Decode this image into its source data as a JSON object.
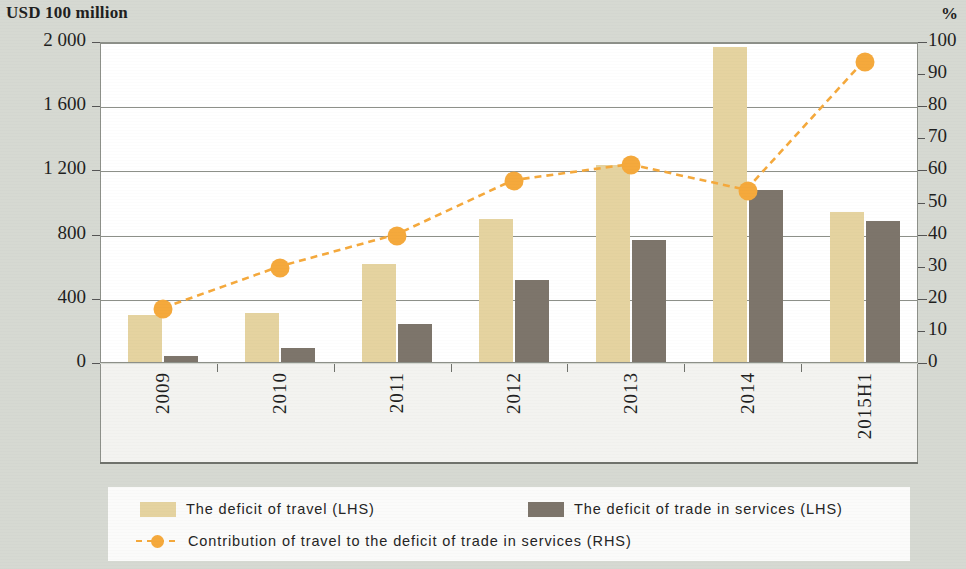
{
  "axis_titles": {
    "left_unit": "USD 100 million",
    "right_unit": "%"
  },
  "left_ticks": [
    "2 000",
    "1 600",
    "1 200",
    "800",
    "400",
    "0"
  ],
  "right_ticks": [
    "100",
    "90",
    "80",
    "70",
    "60",
    "50",
    "40",
    "30",
    "20",
    "10",
    "0"
  ],
  "categories": [
    "2009",
    "2010",
    "2011",
    "2012",
    "2013",
    "2014",
    "2015H1"
  ],
  "legend": {
    "travel": "The deficit of travel (LHS)",
    "services": "The deficit of trade in services (LHS)",
    "contribution": "Contribution of travel to the deficit of trade in services (RHS)"
  },
  "colors": {
    "travel_bar": "#e5d3a0",
    "services_bar": "#7d756b",
    "line": "#f5a93c",
    "page_background": "#d6d9d2",
    "plot_background": "#ffffff",
    "axis": "#8d9089"
  },
  "chart_data": {
    "type": "bar",
    "title": "",
    "xlabel": "",
    "ylabel": "USD 100 million",
    "y2label": "%",
    "categories": [
      "2009",
      "2010",
      "2011",
      "2012",
      "2013",
      "2014",
      "2015H1"
    ],
    "ylim": [
      0,
      2000
    ],
    "y2lim": [
      0,
      100
    ],
    "yticks": [
      0,
      400,
      800,
      1200,
      1600,
      2000
    ],
    "y2ticks": [
      0,
      10,
      20,
      30,
      40,
      50,
      60,
      70,
      80,
      90,
      100
    ],
    "grid": true,
    "legend_position": "bottom",
    "series": [
      {
        "name": "The deficit of travel (LHS)",
        "type": "bar",
        "axis": "left",
        "color": "#e5d3a0",
        "values": [
          290,
          305,
          610,
          890,
          1230,
          1960,
          935
        ]
      },
      {
        "name": "The deficit of trade in services (LHS)",
        "type": "bar",
        "axis": "left",
        "color": "#7d756b",
        "values": [
          35,
          85,
          235,
          510,
          760,
          1070,
          880
        ]
      },
      {
        "name": "Contribution of travel to the deficit of trade in services (RHS)",
        "type": "line",
        "axis": "right",
        "color": "#f5a93c",
        "linestyle": "dashed",
        "marker": "circle",
        "values": [
          17,
          30,
          40,
          57,
          62,
          54,
          94
        ]
      }
    ]
  }
}
